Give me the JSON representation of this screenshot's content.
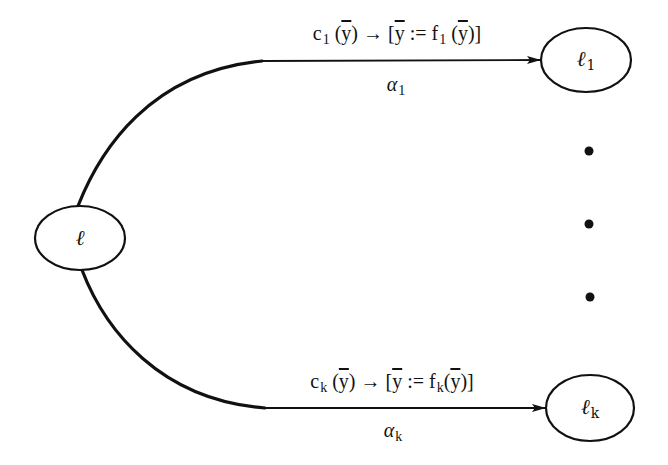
{
  "diagram": {
    "type": "state-transition",
    "colors": {
      "stroke": "#111111",
      "background": "#ffffff"
    },
    "nodes": [
      {
        "id": "l",
        "base": "ℓ",
        "sub": "",
        "cx": 80,
        "cy": 238,
        "rx": 45,
        "ry": 32
      },
      {
        "id": "l1",
        "base": "ℓ",
        "sub": "1",
        "cx": 586,
        "cy": 60,
        "rx": 45,
        "ry": 32
      },
      {
        "id": "lk",
        "base": "ℓ",
        "sub": "k",
        "cx": 590,
        "cy": 408,
        "rx": 44,
        "ry": 33
      }
    ],
    "edges": [
      {
        "id": "edge-1",
        "from": "l",
        "to": "l1",
        "guard": {
          "c": "c",
          "c_sub": "1",
          "y": "y",
          "arrow": "→",
          "assign_open": "[",
          "assign_op": " := ",
          "f": "f",
          "f_sub": "1",
          "assign_close": "]"
        },
        "label": {
          "base": "α",
          "sub": "1"
        }
      },
      {
        "id": "edge-k",
        "from": "l",
        "to": "lk",
        "guard": {
          "c": "c",
          "c_sub": "k",
          "y": "y",
          "arrow": "→",
          "assign_open": "[",
          "assign_op": " := ",
          "f": "f",
          "f_sub": "k",
          "assign_close": "]"
        },
        "label": {
          "base": "α",
          "sub": "k"
        }
      }
    ],
    "ellipsis_dots": [
      {
        "cx": 589,
        "cy": 151
      },
      {
        "cx": 589,
        "cy": 224
      },
      {
        "cx": 590,
        "cy": 297
      }
    ]
  }
}
